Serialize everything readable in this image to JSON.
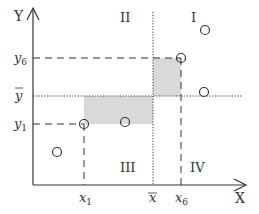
{
  "diagram": {
    "axes": {
      "x_label": "X",
      "y_label": "Y"
    },
    "quadrants": {
      "q1": "I",
      "q2": "II",
      "q3": "III",
      "q4": "IV"
    },
    "x_ticks": {
      "x1": "x",
      "x1_sub": "1",
      "xbar": "x",
      "x6": "x",
      "x6_sub": "6"
    },
    "y_ticks": {
      "y6": "y",
      "y6_sub": "6",
      "ybar": "y",
      "y1": "y",
      "y1_sub": "1"
    },
    "points": [
      {
        "name": "p1",
        "x": 84,
        "y": 124
      },
      {
        "name": "p2",
        "x": 125,
        "y": 122
      },
      {
        "name": "p6",
        "x": 181,
        "y": 58
      },
      {
        "name": "p_top",
        "x": 205,
        "y": 30
      },
      {
        "name": "p_right",
        "x": 204,
        "y": 92
      },
      {
        "name": "p_low",
        "x": 57,
        "y": 152
      }
    ],
    "colors": {
      "axis": "#333333",
      "shade": "#d9d9d9",
      "line": "#333333"
    }
  }
}
